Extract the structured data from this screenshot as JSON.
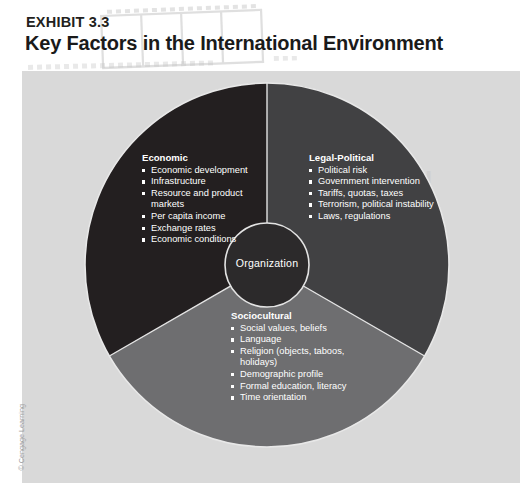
{
  "header": {
    "exhibit_label": "EXHIBIT 3.3",
    "title": "Key Factors in the International Environment"
  },
  "diagram": {
    "center_label": "Organization",
    "ghost_text": "the International",
    "segments": [
      {
        "id": "economic",
        "heading": "Economic",
        "color": "#231f20",
        "items": [
          "Economic development",
          "Infrastructure",
          "Resource and product markets",
          "Per capita income",
          "Exchange rates",
          "Economic conditions"
        ]
      },
      {
        "id": "legal-political",
        "heading": "Legal-Political",
        "color": "#414143",
        "items": [
          "Political risk",
          "Government intervention",
          "Tariffs, quotas, taxes",
          "Terrorism, political instability",
          "Laws, regulations"
        ]
      },
      {
        "id": "sociocultural",
        "heading": "Sociocultural",
        "color": "#6e6e70",
        "items": [
          "Social values, beliefs",
          "Language",
          "Religion (objects, taboos, holidays)",
          "Demographic profile",
          "Formal education, literacy",
          "Time orientation"
        ]
      }
    ]
  },
  "credit": {
    "text": "© Cengage Learning"
  },
  "colors": {
    "page_background": "#ffffff",
    "panel_background": "#d9d9d9",
    "economic": "#231f20",
    "legal_political": "#414143",
    "sociocultural": "#6e6e70",
    "center_circle": "#2c2a2b",
    "text": "#ffffff",
    "title": "#1a1a1a"
  }
}
